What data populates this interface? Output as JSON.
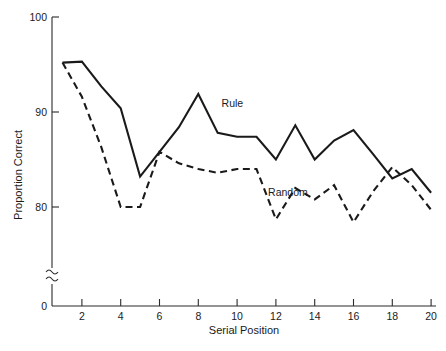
{
  "chart_data": {
    "type": "line",
    "title": "",
    "xlabel": "Serial Position",
    "ylabel": "Proportion Correct",
    "x": [
      1,
      2,
      3,
      4,
      5,
      6,
      7,
      8,
      9,
      10,
      11,
      12,
      13,
      14,
      15,
      16,
      17,
      18,
      19,
      20
    ],
    "xlim": [
      1,
      20
    ],
    "ylim": [
      78,
      100
    ],
    "y_axis_break": true,
    "y_axis_zero_label": "0",
    "xticks": [
      2,
      4,
      6,
      8,
      10,
      12,
      14,
      16,
      18,
      20
    ],
    "yticks": [
      80,
      90,
      100
    ],
    "grid": false,
    "legend_position": "inline-annotations",
    "series": [
      {
        "name": "Rule",
        "linestyle": "solid",
        "color": "#1a1a1a",
        "label_x": 9.2,
        "label_y": 90.5,
        "values": [
          95.2,
          95.3,
          92.7,
          90.4,
          83.2,
          85.8,
          88.4,
          91.9,
          87.8,
          87.4,
          87.4,
          85.0,
          88.6,
          85.0,
          87.0,
          88.1,
          85.6,
          83.0,
          84.0,
          81.5
        ]
      },
      {
        "name": "Random",
        "linestyle": "dashed",
        "color": "#1a1a1a",
        "label_x": 11.6,
        "label_y": 81.2,
        "values": [
          95.2,
          91.6,
          86.3,
          80.0,
          80.0,
          85.8,
          84.6,
          84.0,
          83.6,
          84.0,
          84.0,
          78.7,
          82.0,
          80.8,
          82.3,
          78.4,
          81.6,
          84.2,
          82.3,
          79.7
        ]
      }
    ],
    "annotations": [
      {
        "text": "Rule",
        "x": 9.2,
        "y": 90.5
      },
      {
        "text": "Random",
        "x": 11.6,
        "y": 81.2
      }
    ]
  },
  "axes": {
    "y_title": "Proportion Correct",
    "x_title": "Serial Position",
    "y_tick_labels": [
      "100",
      "90",
      "80",
      "0"
    ],
    "x_tick_labels": [
      "2",
      "4",
      "6",
      "8",
      "10",
      "12",
      "14",
      "16",
      "18",
      "20"
    ]
  }
}
